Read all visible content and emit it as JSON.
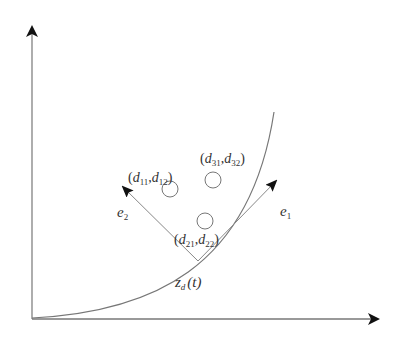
{
  "diagram": {
    "type": "trajectory-frame",
    "colors": {
      "stroke": "#777777",
      "arrow": "#111111",
      "text": "#333333",
      "background": "#ffffff"
    },
    "axes": {
      "origin": [
        32,
        319
      ],
      "y_tip": [
        32,
        25
      ],
      "x_tip": [
        380,
        319
      ]
    },
    "curve": {
      "name": "z_d(t)",
      "path": "M 32 318 C 150 312, 250 270, 274 112"
    },
    "frame_point": [
      198,
      261
    ],
    "vectors": [
      {
        "id": "e1",
        "tip": [
          277,
          180
        ]
      },
      {
        "id": "e2",
        "tip": [
          122,
          186
        ]
      }
    ],
    "circles": [
      {
        "id": "1",
        "cx": 170,
        "cy": 189,
        "r": 8
      },
      {
        "id": "3",
        "cx": 213,
        "cy": 180,
        "r": 8
      },
      {
        "id": "2",
        "cx": 205,
        "cy": 221,
        "r": 8
      }
    ],
    "labels": {
      "circle1": {
        "open": "(",
        "v1": "d",
        "s1": "11",
        "comma": ",",
        "v2": "d",
        "s2": "12",
        "close": ")"
      },
      "circle3": {
        "open": "(",
        "v1": "d",
        "s1": "31",
        "comma": ",",
        "v2": "d",
        "s2": "32",
        "close": ")"
      },
      "circle2": {
        "open": "(",
        "v1": "d",
        "s1": "21",
        "comma": ",",
        "v2": "d",
        "s2": "22",
        "close": ")"
      },
      "e1": {
        "base": "e",
        "sub": "1"
      },
      "e2": {
        "base": "e",
        "sub": "2"
      },
      "curve": {
        "base": "z",
        "sub": "d",
        "arg": "(t)"
      }
    }
  }
}
